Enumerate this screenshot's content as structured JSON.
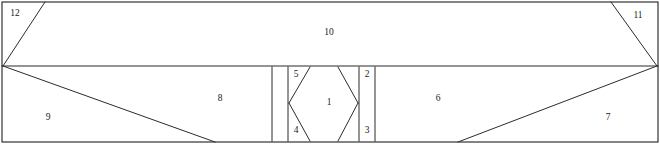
{
  "diagram": {
    "type": "planar-subdivision",
    "canvas": {
      "width": 660,
      "height": 144
    },
    "colors": {
      "background": "#ffffff",
      "line": "#2b2b2b",
      "label": "#1a1a1a"
    },
    "regions": [
      {
        "id": "region-1",
        "label": "1",
        "x": 329,
        "y": 103,
        "description": "central hexagon interior"
      },
      {
        "id": "region-2",
        "label": "2",
        "x": 367,
        "y": 75,
        "description": "upper-right hexagon corner triangle"
      },
      {
        "id": "region-3",
        "label": "3",
        "x": 367,
        "y": 131,
        "description": "lower-right hexagon corner triangle"
      },
      {
        "id": "region-4",
        "label": "4",
        "x": 296,
        "y": 131,
        "description": "lower-left hexagon corner triangle"
      },
      {
        "id": "region-5",
        "label": "5",
        "x": 296,
        "y": 75,
        "description": "upper-left hexagon corner triangle"
      },
      {
        "id": "region-6",
        "label": "6",
        "x": 438,
        "y": 99,
        "description": "lower band right of hexagon"
      },
      {
        "id": "region-7",
        "label": "7",
        "x": 608,
        "y": 118,
        "description": "lower-right triangle"
      },
      {
        "id": "region-8",
        "label": "8",
        "x": 220,
        "y": 99,
        "description": "lower band left of hexagon"
      },
      {
        "id": "region-9",
        "label": "9",
        "x": 48,
        "y": 118,
        "description": "lower-left triangle"
      },
      {
        "id": "region-10",
        "label": "10",
        "x": 329,
        "y": 33,
        "description": "upper trapezoid band"
      },
      {
        "id": "region-11",
        "label": "11",
        "x": 638,
        "y": 16,
        "description": "upper-right corner triangle"
      },
      {
        "id": "region-12",
        "label": "12",
        "x": 15,
        "y": 14,
        "description": "upper-left corner triangle"
      }
    ],
    "vertices": {
      "outer_top_left": {
        "x": 2,
        "y": 2
      },
      "outer_top_right": {
        "x": 658,
        "y": 2
      },
      "outer_bottom_left": {
        "x": 2,
        "y": 142
      },
      "outer_bottom_right": {
        "x": 658,
        "y": 142
      },
      "left_node": {
        "x": 3,
        "y": 66
      },
      "right_node": {
        "x": 657,
        "y": 66
      },
      "top_left_apex": {
        "x": 45,
        "y": 2
      },
      "top_right_apex": {
        "x": 611,
        "y": 2
      },
      "bottom_left_apex": {
        "x": 215,
        "y": 142
      },
      "bottom_right_apex": {
        "x": 458,
        "y": 142
      },
      "hex_left_wall_x": {
        "x": 272,
        "y": 0
      },
      "hex_right_wall_x": {
        "x": 375,
        "y": 0
      },
      "hex_left_point": {
        "x": 289,
        "y": 103
      },
      "hex_right_point": {
        "x": 358,
        "y": 103
      },
      "hex_top_left": {
        "x": 303,
        "y": 67
      },
      "hex_top_right": {
        "x": 345,
        "y": 67
      },
      "hex_bottom_left": {
        "x": 303,
        "y": 141
      },
      "hex_bottom_right": {
        "x": 345,
        "y": 141
      }
    }
  }
}
